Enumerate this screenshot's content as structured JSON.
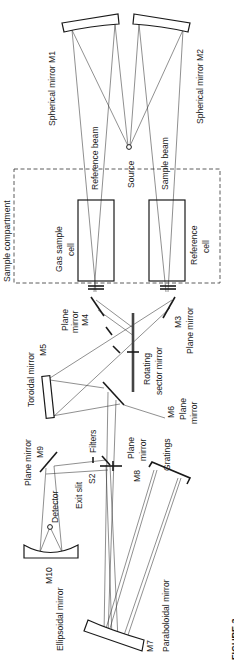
{
  "diagram": {
    "orientation": "rotated 90 degrees",
    "labels": {
      "m1": "Spherical mirror  M1",
      "m2": "Spherical mirror  M2",
      "reference_beam": "Reference beam",
      "sample_beam": "Sample beam",
      "source": "Source",
      "sample_compartment": "Sample compartment",
      "gas_cell_line1": "Gas sample",
      "gas_cell_line2": "cell",
      "ref_cell_line1": "Reference",
      "ref_cell_line2": "cell",
      "m4_line1": "Plane",
      "m4_line2": "mirror",
      "m4_line3": "M4",
      "m3_line1": "M3",
      "m3_line2": "Plane mirror",
      "m5_line1": "Toroidal mirror",
      "m5_line2": "M5",
      "rotating_line1": "Rotating",
      "rotating_line2": "sector mirror",
      "m6_line1": "M6",
      "m6_line2": "Plane",
      "m6_line3": "mirror",
      "m9_line1": "Plane mirror",
      "m9_line2": "M9",
      "filters": "Filters",
      "exit_slit_line1": "Exit slit",
      "exit_slit_line2": "S2",
      "m8_line1": "Plane",
      "m8_line2": "mirror",
      "m8_line3": "M8",
      "gratings": "Gratings",
      "detector": "Detector",
      "m10_line1": "M10",
      "m10_line2": "Ellipsoidal mirror",
      "m7_line1": "M7",
      "m7_line2": "Paraboloidal mirror",
      "figure": "FIGURE 3"
    }
  }
}
